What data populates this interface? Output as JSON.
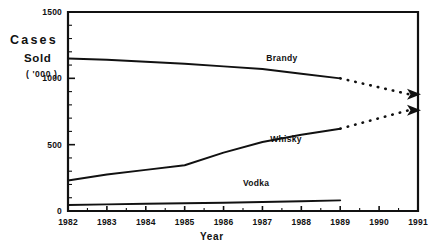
{
  "chart_data": {
    "type": "line",
    "title": "",
    "xlabel": "Year",
    "ylabel": "Cases Sold ('000)",
    "ylabel_line1": "Cases",
    "ylabel_line2": "Sold",
    "ylabel_line3": "( '000 )",
    "x": [
      1982,
      1983,
      1984,
      1985,
      1986,
      1987,
      1988,
      1989,
      1990,
      1991
    ],
    "categories": [
      "1982",
      "1983",
      "1984",
      "1985",
      "1986",
      "1987",
      "1988",
      "1989",
      "1990",
      "1991"
    ],
    "xlim": [
      1982,
      1991
    ],
    "ylim": [
      0,
      1500
    ],
    "y_ticks": [
      0,
      500,
      1000,
      1500
    ],
    "y_tick_labels": [
      "0",
      "500",
      "1000",
      "1500"
    ],
    "y_minor_step": 100,
    "grid": false,
    "legend": "inline-labels",
    "series": [
      {
        "name": "Brandy",
        "label": "Brandy",
        "style": "solid-then-dotted",
        "solid_x": [
          1982,
          1983,
          1984,
          1985,
          1986,
          1987,
          1988,
          1989
        ],
        "solid_values": [
          1150,
          1140,
          1125,
          1110,
          1090,
          1070,
          1035,
          1000
        ],
        "projected_x": [
          1989,
          1991
        ],
        "projected_values": [
          1000,
          880
        ]
      },
      {
        "name": "Whisky",
        "label": "Whisky",
        "style": "solid-then-dotted",
        "solid_x": [
          1982,
          1983,
          1984,
          1985,
          1986,
          1987,
          1988,
          1989
        ],
        "solid_values": [
          230,
          275,
          310,
          345,
          440,
          520,
          575,
          620
        ],
        "projected_x": [
          1989,
          1991
        ],
        "projected_values": [
          620,
          760
        ]
      },
      {
        "name": "Vodka",
        "label": "Vodka",
        "style": "solid",
        "solid_x": [
          1982,
          1983,
          1984,
          1985,
          1986,
          1987,
          1988,
          1989
        ],
        "solid_values": [
          45,
          50,
          55,
          58,
          62,
          68,
          74,
          80
        ],
        "projected_x": [],
        "projected_values": []
      }
    ],
    "annotations": [
      {
        "text": "Brandy",
        "x": 1987.1,
        "y": 1130
      },
      {
        "text": "Whisky",
        "x": 1987.2,
        "y": 520
      },
      {
        "text": "Vodka",
        "x": 1986.5,
        "y": 190
      }
    ],
    "colors": {
      "line": "#111111",
      "text": "#111111",
      "background": "#ffffff"
    }
  }
}
